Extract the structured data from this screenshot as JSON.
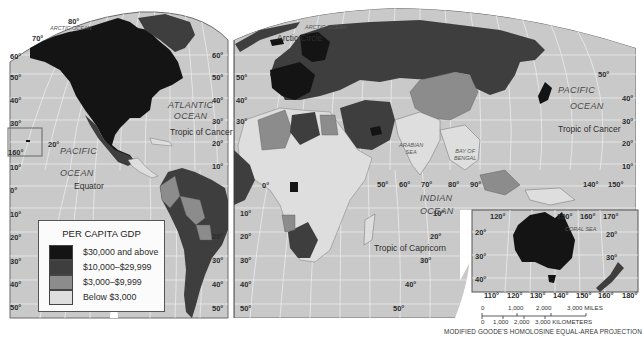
{
  "map": {
    "title": "PER CAPITA GDP",
    "projection": "MODIFIED GOODE'S HOMOLOSINE EQUAL-AREA PROJECTION",
    "colors": {
      "ocean": "#c9c9c9",
      "grid": "#ededed",
      "above_30000": "#141414",
      "10000_29999": "#3e3e3e",
      "3000_9999": "#8c8c8c",
      "below_3000": "#dedede",
      "border": "#5a5a5a"
    }
  },
  "legend": {
    "title": "PER CAPITA GDP",
    "items": [
      {
        "label": "$30,000 and above",
        "color": "#141414"
      },
      {
        "label": "$10,000–$29,999",
        "color": "#3e3e3e"
      },
      {
        "label": "$3,000–$9,999",
        "color": "#8c8c8c"
      },
      {
        "label": "Below $3,000",
        "color": "#dedede"
      }
    ]
  },
  "oceans": {
    "arctic_west": "ARCTIC OCEAN",
    "arctic_east": "ARCTIC OCEAN",
    "atlantic_1": "ATLANTIC",
    "atlantic_2": "OCEAN",
    "pacific_west_1": "PACIFIC",
    "pacific_west_2": "OCEAN",
    "pacific_east_1": "PACIFIC",
    "pacific_east_2": "OCEAN",
    "indian_1": "INDIAN",
    "indian_2": "OCEAN",
    "arabian_sea_1": "ARABIAN",
    "arabian_sea_2": "SEA",
    "bay_of_bengal_1": "BAY OF",
    "bay_of_bengal_2": "BENGAL",
    "coral_sea": "CORAL SEA"
  },
  "lines": {
    "arctic_circle": "Arctic Circle",
    "tropic_cancer_west": "Tropic of Cancer",
    "tropic_cancer_east": "Tropic of Cancer",
    "equator": "Equator",
    "tropic_capricorn": "Tropic of Capricorn"
  },
  "graticule": {
    "west_left": [
      "70°",
      "60°",
      "50°",
      "40°",
      "30°",
      "20°",
      "10°",
      "0°",
      "10°",
      "20°",
      "30°",
      "40°",
      "50°"
    ],
    "west_top": "80°",
    "west_right": [
      "60°",
      "50°",
      "40°",
      "30°",
      "20°",
      "10°",
      "20°",
      "30°",
      "40°",
      "50°"
    ],
    "east_left": [
      "50°",
      "40°",
      "30°",
      "0°",
      "10°",
      "20°",
      "30°",
      "40°",
      "50°"
    ],
    "east_right": [
      "50°",
      "40°",
      "30°",
      "20°",
      "10°"
    ],
    "east_bottom_lat": [
      "10°",
      "20°",
      "30°",
      "40°",
      "50°"
    ],
    "longitudes": [
      "50°",
      "60°",
      "70°",
      "80°",
      "90°",
      "140°",
      "150°"
    ],
    "hawaii_inset": [
      "160°",
      "20°"
    ],
    "australia_top": [
      "120°",
      "150°",
      "160°",
      "170°"
    ],
    "australia_lat": [
      "20°",
      "30°",
      "40°",
      "20°",
      "30°"
    ],
    "australia_bottom": [
      "110°",
      "120°",
      "130°",
      "140°",
      "150°",
      "160°",
      "180°"
    ]
  },
  "scale_bar": {
    "miles": [
      "0",
      "1,000",
      "2,000",
      "3,000 MILES"
    ],
    "kilometers": [
      "0",
      "1,000",
      "2,000",
      "3,000 KILOMETERS"
    ]
  }
}
